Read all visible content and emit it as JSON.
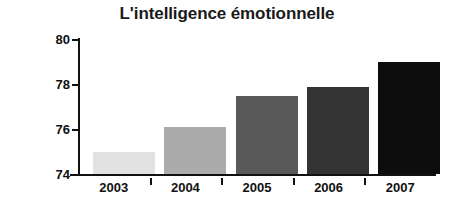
{
  "chart_data": {
    "type": "bar",
    "title": "L'intelligence émotionnelle",
    "xlabel": "",
    "ylabel": "QE moyen",
    "categories": [
      "2003",
      "2004",
      "2005",
      "2006",
      "2007"
    ],
    "values": [
      75.0,
      76.1,
      77.45,
      77.85,
      79.0
    ],
    "ylim": [
      74,
      80
    ],
    "yticks": [
      74,
      76,
      78,
      80
    ],
    "ytick_labels": [
      "74",
      "76",
      "78",
      "80"
    ],
    "grid": false,
    "legend": null,
    "bar_colors": [
      "#e2e2e2",
      "#ababab",
      "#595959",
      "#333333",
      "#0d0d0d"
    ],
    "axis_color": "#111111",
    "background": "#ffffff"
  }
}
